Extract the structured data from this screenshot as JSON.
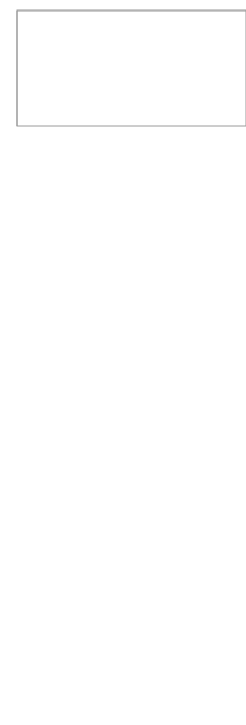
{
  "colors": {
    "band_fill": "#a6a6a6",
    "firm_fill": "#c8c8c8",
    "dark_fill": "#9c9c9c",
    "light_fill": "#dcdcdc",
    "white_fill": "#ffffff",
    "stroke": "#777777",
    "line": "#555555",
    "frame": "#999999"
  },
  "top_diagram": {
    "band_left_label": "Public private Partnership",
    "band_right_label": "(Public & Private) Support Institution",
    "forward_linkages": "Forward linkages",
    "global_buyers": "Global buyers",
    "final_markets": "Final markets",
    "export_consortium": "Export consortium",
    "larger_firm": "Larger Firm",
    "firm": "Firm",
    "supplier": "Supplier",
    "backward_linkages": "Backward linkages",
    "raw_material_suppliers": "Raw material suppliers",
    "equipment_suppliers": "Equipment suppliers"
  },
  "bottom_diagram": {
    "service_provider": "Service Provider",
    "support_institution": "Support Institution",
    "support_institution_two_line": "Support Institution",
    "local_government": "Local Government",
    "firm": "Firm",
    "supplier": "Supplier"
  }
}
